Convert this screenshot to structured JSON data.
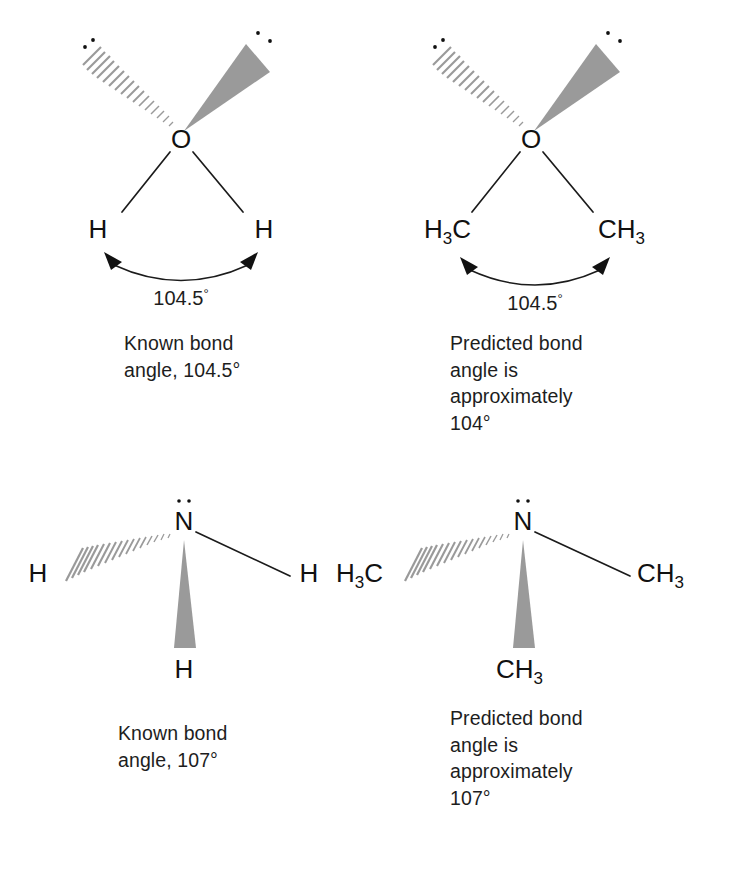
{
  "figure": {
    "background_color": "#ffffff",
    "ink_color": "#111111",
    "wedge_gray": "#9a9a9a"
  },
  "panels": [
    {
      "id": "water",
      "central_atom": "O",
      "substituents": [
        "H",
        "H"
      ],
      "lone_pairs": 2,
      "angle_label": "104.5",
      "degree_symbol": "°",
      "caption": "Known bond\nangle, 104.5°"
    },
    {
      "id": "dimethyl-ether",
      "central_atom": "O",
      "substituents": [
        "H₃C",
        "CH₃"
      ],
      "lone_pairs": 2,
      "angle_label": "104.5",
      "degree_symbol": "°",
      "caption": "Predicted bond\nangle is\napproximately\n104°"
    },
    {
      "id": "ammonia",
      "central_atom": "N",
      "substituents": [
        "H",
        "H",
        "H"
      ],
      "lone_pairs": 1,
      "angle_label": "",
      "degree_symbol": "°",
      "caption": "Known bond\nangle, 107°"
    },
    {
      "id": "trimethylamine",
      "central_atom": "N",
      "substituents": [
        "H₃C",
        "CH₃",
        "CH₃"
      ],
      "lone_pairs": 1,
      "angle_label": "",
      "degree_symbol": "°",
      "caption": "Predicted bond\nangle is\napproximately\n107°"
    }
  ],
  "labels": {
    "water": {
      "center": "O",
      "left_sub": "H",
      "right_sub": "H",
      "angle_value": "104.5",
      "angle_degree": "°"
    },
    "ether": {
      "center": "O",
      "left_sub_main": "H",
      "left_sub_num": "3",
      "left_sub_tail": "C",
      "right_sub_main": "CH",
      "right_sub_num": "3",
      "angle_value": "104.5",
      "angle_degree": "°"
    },
    "ammonia": {
      "center": "N",
      "left_sub": "H",
      "right_sub": "H",
      "front_sub": "H"
    },
    "amine": {
      "center": "N",
      "left_sub_main": "H",
      "left_sub_num": "3",
      "left_sub_tail": "C",
      "right_sub_main": "CH",
      "right_sub_num": "3",
      "front_sub_main": "CH",
      "front_sub_num": "3"
    }
  },
  "captions": {
    "top_left": "Known bond\nangle, 104.5°",
    "top_right": "Predicted bond\nangle is\napproximately\n104°",
    "bottom_left": "Known bond\nangle, 107°",
    "bottom_right": "Predicted bond\nangle is\napproximately\n107°"
  }
}
